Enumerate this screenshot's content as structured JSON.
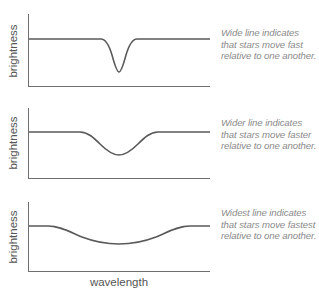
{
  "diagram": {
    "y_axis_label": "brightness",
    "x_axis_label": "wavelength",
    "colors": {
      "axis": "#6f6f6f",
      "curve": "#5a5a5a",
      "label": "#555555",
      "note": "#8a8a8a"
    },
    "panels": [
      {
        "id": "wide",
        "ylabel": "brightness",
        "note_lines": [
          "Wide line indicates",
          "that stars move fast",
          "relative to one another."
        ],
        "note": "Wide line indicates that stars move fast relative to one another."
      },
      {
        "id": "wider",
        "ylabel": "brightness",
        "note_lines": [
          "Wider line indicates",
          "that stars move faster",
          "relative to one another."
        ],
        "note": "Wider line indicates that stars move faster relative to one another."
      },
      {
        "id": "widest",
        "ylabel": "brightness",
        "note_lines": [
          "Widest line indicates",
          "that stars move fastest",
          "relative to one another."
        ],
        "note": "Widest line indicates that stars move fastest relative to one another."
      }
    ]
  }
}
